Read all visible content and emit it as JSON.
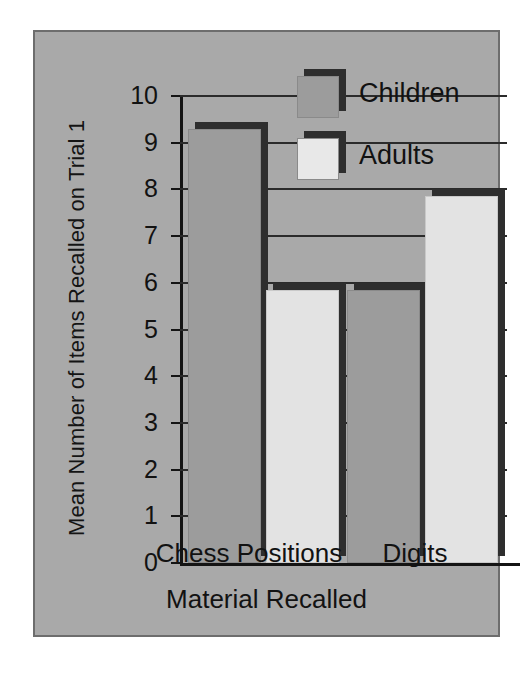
{
  "figure": {
    "panel_color": "#a9a9a9",
    "border_color": "#6d6d6d"
  },
  "chart_data": {
    "type": "bar",
    "title": "",
    "xlabel": "Material Recalled",
    "ylabel": "Mean Number of Items Recalled on Trial 1",
    "categories": [
      "Chess Positions",
      "Digits"
    ],
    "series": [
      {
        "name": "Children",
        "values": [
          9.3,
          5.85
        ],
        "color": "#9c9c9c"
      },
      {
        "name": "Adults",
        "values": [
          5.85,
          7.85
        ],
        "color": "#e3e3e3"
      }
    ],
    "ylim": [
      0,
      10
    ],
    "yticks": [
      "0",
      "1",
      "2",
      "3",
      "4",
      "5",
      "6",
      "7",
      "8",
      "9",
      "10"
    ],
    "grid": true,
    "legend_position": "upper-center",
    "legend": [
      "Children",
      "Adults"
    ]
  },
  "axis": {
    "y_title": "Mean Number of Items Recalled on Trial 1",
    "x_title": "Material Recalled",
    "y_ticks": [
      "10",
      "9",
      "8",
      "7",
      "6",
      "5",
      "4",
      "3",
      "2",
      "1",
      "0"
    ]
  },
  "legend": {
    "items": [
      {
        "label": "Children",
        "swatch": "children-swatch"
      },
      {
        "label": "Adults",
        "swatch": "adults-swatch"
      }
    ]
  },
  "x_categories": [
    {
      "label": "Chess Positions"
    },
    {
      "label": "Digits"
    }
  ]
}
